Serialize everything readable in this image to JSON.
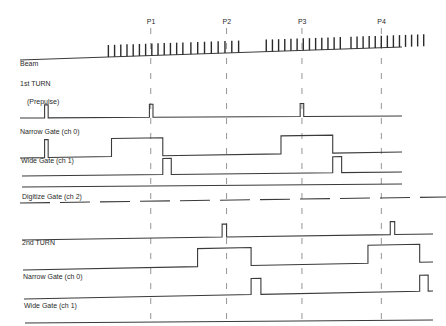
{
  "diagram": {
    "markers": [
      {
        "label": "P1",
        "t": 0.338
      },
      {
        "label": "P2",
        "t": 0.508
      },
      {
        "label": "P3",
        "t": 0.677
      },
      {
        "label": "P4",
        "t": 0.855
      }
    ],
    "beam": {
      "label": "Beam",
      "trains": [
        {
          "start": 0.243,
          "end": 0.41,
          "bunches": 13
        },
        {
          "start": 0.428,
          "end": 0.535,
          "bunches": 8
        },
        {
          "start": 0.597,
          "end": 0.763,
          "bunches": 13
        },
        {
          "start": 0.787,
          "end": 0.95,
          "bunches": 13
        }
      ]
    },
    "sections": [
      {
        "title": "1st TURN",
        "signals": [
          {
            "label": "(Prepulse)",
            "name": "prepulse",
            "pulses": [
              [
                0.1,
                0.108
              ],
              [
                0.335,
                0.343
              ],
              [
                0.673,
                0.681
              ]
            ]
          },
          {
            "label": "Narrow Gate (ch 0)",
            "name": "narrow-gate",
            "pulses": [
              [
                0.1,
                0.108
              ],
              [
                0.25,
                0.365
              ],
              [
                0.63,
                0.746
              ]
            ]
          },
          {
            "label": "Wide Gate (ch 1)",
            "name": "wide-gate",
            "pulses": [
              [
                0.365,
                0.384
              ],
              [
                0.746,
                0.766
              ]
            ]
          },
          {
            "label": "Digitize Gate (ch 2)",
            "name": "digitize-gate",
            "pulses": []
          }
        ]
      },
      {
        "title": "2nd TURN",
        "signals": [
          {
            "label": "",
            "name": "prepulse-2",
            "pulses": [
              [
                0.498,
                0.508
              ],
              [
                0.875,
                0.885
              ]
            ]
          },
          {
            "label": "Narrow Gate (ch 0)",
            "name": "narrow-gate-2",
            "pulses": [
              [
                0.443,
                0.563
              ],
              [
                0.825,
                0.941
              ]
            ]
          },
          {
            "label": "Wide Gate (ch 1)",
            "name": "wide-gate-2",
            "pulses": [
              [
                0.563,
                0.585
              ],
              [
                0.941,
                0.96
              ]
            ]
          },
          {
            "label": "Digitize Gate (ch 2)",
            "name": "digitize-gate-2",
            "pulses": []
          }
        ]
      }
    ]
  }
}
